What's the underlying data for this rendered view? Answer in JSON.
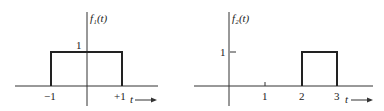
{
  "plots": [
    {
      "ylabel": "f₁(t)",
      "level_label": "1",
      "x_ticks": [
        "−1",
        "+1"
      ],
      "xlabel": "t",
      "pulse": {
        "start": -1,
        "end": 1,
        "height": 1
      }
    },
    {
      "ylabel": "f₂(t)",
      "level_label": "1",
      "x_ticks": [
        "1",
        "2",
        "3"
      ],
      "xlabel": "t",
      "pulse": {
        "start": 2,
        "end": 3,
        "height": 1
      }
    }
  ]
}
